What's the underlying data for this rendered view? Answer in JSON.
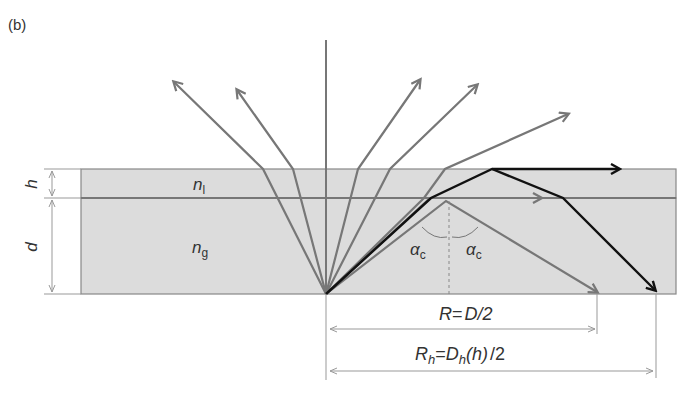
{
  "panel_label": "(b)",
  "colors": {
    "background": "#ffffff",
    "layer_fill": "#dcdcdc",
    "border": "#888888",
    "ray_gray": "#777777",
    "ray_dark": "#111111",
    "dim_line": "#999999",
    "text": "#333333"
  },
  "layers": {
    "top": {
      "index_symbol": "n",
      "index_subscript": "l",
      "thickness_label": "h"
    },
    "bottom": {
      "index_symbol": "n",
      "index_subscript": "g",
      "thickness_label": "d"
    }
  },
  "angles": {
    "left": {
      "symbol": "α",
      "subscript": "c"
    },
    "right": {
      "symbol": "α",
      "subscript": "c"
    }
  },
  "dimensions": {
    "R": {
      "lhs": "R",
      "eq": "=",
      "rhs": "D/2"
    },
    "Rh": {
      "lhs": "R",
      "lhs_sub": "h",
      "eq": "=",
      "rhs_main": "D",
      "rhs_sub": "h",
      "rhs_paren": "(h)",
      "rhs_tail": "/2"
    }
  }
}
